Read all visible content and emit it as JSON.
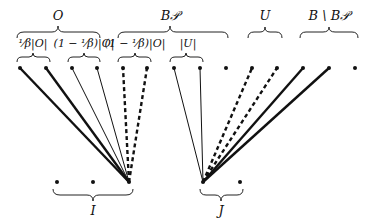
{
  "labels": {
    "O": "O",
    "B_P": "B𝒫",
    "U": "U",
    "B_minus_BP": "B \\ B𝒫",
    "frac_O": "¹⁄β|O|",
    "one_minus_frac_O_1": "(1 − ¹⁄β)|O|",
    "one_minus_frac_O_2": "(1 − ¹⁄β)|O|",
    "abs_U": "|U|",
    "I": "I",
    "J": "J"
  },
  "top_points_x": [
    20,
    46,
    72,
    97,
    123,
    147,
    174,
    200,
    226,
    252,
    277,
    303,
    329,
    355
  ],
  "bottom_points": {
    "I": [
      57,
      93,
      129
    ],
    "J": [
      203,
      240
    ]
  },
  "edges": [
    {
      "from": 129,
      "to": 20,
      "style": "thick"
    },
    {
      "from": 129,
      "to": 46,
      "style": "thick"
    },
    {
      "from": 129,
      "to": 72,
      "style": "thin"
    },
    {
      "from": 129,
      "to": 97,
      "style": "thin"
    },
    {
      "from": 129,
      "to": 123,
      "style": "dashed"
    },
    {
      "from": 129,
      "to": 147,
      "style": "dashed"
    },
    {
      "from": 203,
      "to": 174,
      "style": "thin"
    },
    {
      "from": 203,
      "to": 200,
      "style": "thin"
    },
    {
      "from": 203,
      "to": 252,
      "style": "dashed"
    },
    {
      "from": 203,
      "to": 277,
      "style": "dashed"
    },
    {
      "from": 203,
      "to": 303,
      "style": "thick"
    },
    {
      "from": 203,
      "to": 329,
      "style": "thick"
    }
  ]
}
